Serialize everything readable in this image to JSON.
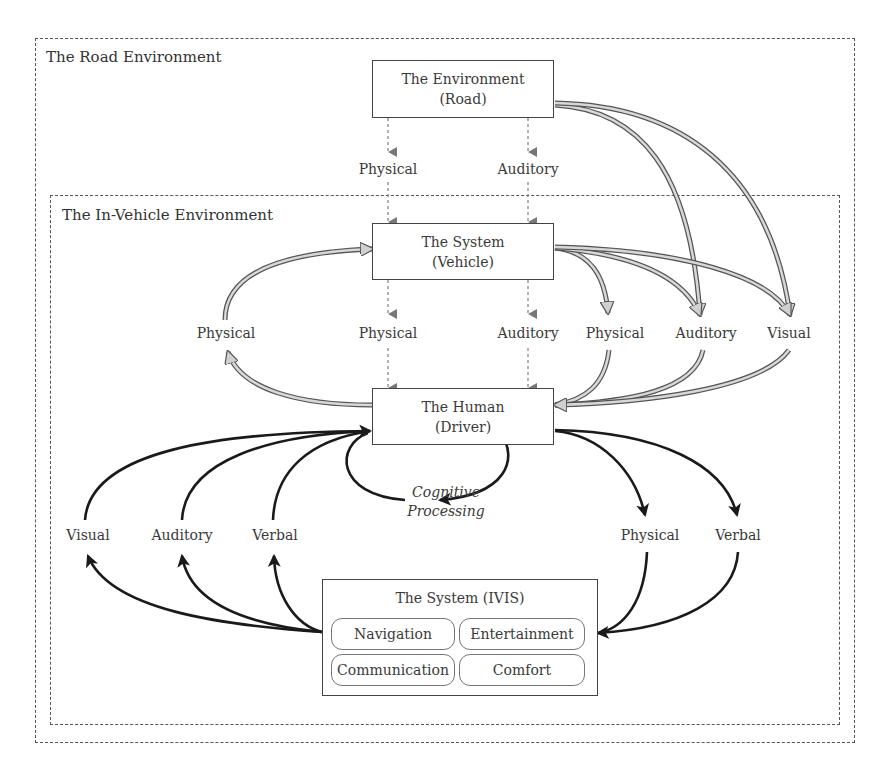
{
  "containers": {
    "road": {
      "label": "The Road Environment"
    },
    "in_vehicle": {
      "label": "The In-Vehicle Environment"
    }
  },
  "nodes": {
    "environment": {
      "line1": "The Environment",
      "line2": "(Road)"
    },
    "vehicle": {
      "line1": "The System",
      "line2": "(Vehicle)"
    },
    "driver": {
      "line1": "The Human",
      "line2": "(Driver)"
    },
    "ivis": {
      "title": "The System (IVIS)",
      "modules": [
        "Navigation",
        "Entertainment",
        "Communication",
        "Comfort"
      ]
    }
  },
  "edge_labels": {
    "road_to_vehicle_physical": "Physical",
    "road_to_vehicle_auditory": "Auditory",
    "vehicle_to_driver_physical": "Physical",
    "vehicle_to_driver_auditory": "Auditory",
    "driver_to_vehicle_physical": "Physical",
    "to_driver_physical": "Physical",
    "to_driver_auditory": "Auditory",
    "to_driver_visual": "Visual",
    "ivis_to_driver_visual": "Visual",
    "ivis_to_driver_auditory": "Auditory",
    "ivis_to_driver_verbal": "Verbal",
    "driver_to_ivis_physical": "Physical",
    "driver_to_ivis_verbal": "Verbal",
    "cognitive_line1": "Cognitive",
    "cognitive_line2": "Processing"
  },
  "colors": {
    "dashed_arrow": "#777777",
    "hollow_arrow_fill": "#d0d0d0",
    "hollow_arrow_stroke": "#555555",
    "solid_arrow": "#1a1a1a",
    "box_border": "#444444"
  }
}
